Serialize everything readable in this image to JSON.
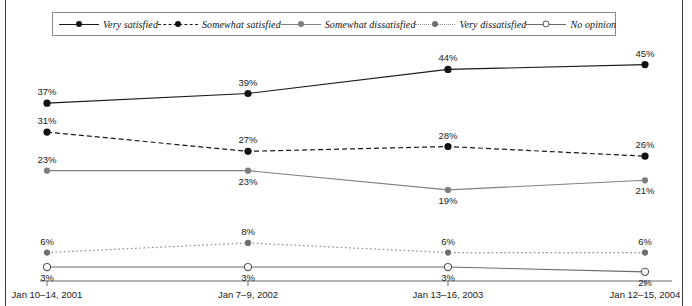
{
  "chart_data": {
    "type": "line",
    "title": "",
    "subtitle": "",
    "xlabel": "",
    "ylabel": "",
    "grid": false,
    "legend_position": "top",
    "ylim": [
      0,
      50
    ],
    "categories": [
      "Jan 10–14, 2001",
      "Jan 7–9, 2002",
      "Jan 13–16, 2003",
      "Jan 12–15, 2004"
    ],
    "series": [
      {
        "name": "Very satisfied",
        "values": [
          37,
          39,
          44,
          45
        ],
        "labels": [
          "37%",
          "39%",
          "44%",
          "45%"
        ],
        "color": "#1a1a1a",
        "line_style": "solid",
        "marker": "filled-circle",
        "marker_color": "#111111",
        "label_positions": [
          "above",
          "above",
          "above",
          "above"
        ]
      },
      {
        "name": "Somewhat satisfied",
        "values": [
          31,
          27,
          28,
          26
        ],
        "labels": [
          "31%",
          "27%",
          "28%",
          "26%"
        ],
        "color": "#1a1a1a",
        "line_style": "dashed",
        "marker": "filled-circle",
        "marker_color": "#111111",
        "label_positions": [
          "above",
          "above",
          "above",
          "above"
        ]
      },
      {
        "name": "Somewhat dissatisfied",
        "values": [
          23,
          23,
          19,
          21
        ],
        "labels": [
          "23%",
          "23%",
          "19%",
          "21%"
        ],
        "color": "#808080",
        "line_style": "solid",
        "marker": "filled-circle",
        "marker_color": "#7d7d7d",
        "label_positions": [
          "above",
          "below",
          "below",
          "below"
        ]
      },
      {
        "name": "Very dissatisfied",
        "values": [
          6,
          8,
          6,
          6
        ],
        "labels": [
          "6%",
          "8%",
          "6%",
          "6%"
        ],
        "color": "#8c8c8c",
        "line_style": "dotted",
        "marker": "filled-circle",
        "marker_color": "#6e6e6e",
        "label_positions": [
          "above",
          "above",
          "above",
          "above"
        ]
      },
      {
        "name": "No opinion",
        "values": [
          3,
          3,
          3,
          2
        ],
        "labels": [
          "3%",
          "3%",
          "3%",
          "2%"
        ],
        "color": "#6a6a6a",
        "line_style": "solid",
        "marker": "open-circle",
        "marker_color": "#555555",
        "label_positions": [
          "below",
          "below",
          "below",
          "below"
        ]
      }
    ]
  },
  "legend": {
    "items": [
      {
        "label": "Very satisfied",
        "swatch": "solid-filled-dot-marker"
      },
      {
        "label": "Somewhat satisfied",
        "swatch": "dashed-filled-dot-marker"
      },
      {
        "label": "Somewhat dissatisfied",
        "swatch": "solid-gray-filled-dot-marker"
      },
      {
        "label": "Very dissatisfied",
        "swatch": "dotted-gray-filled-dot-marker"
      },
      {
        "label": "No opinion",
        "swatch": "solid-gray-open-circle-marker"
      }
    ]
  },
  "axis": {
    "tick_labels": [
      "Jan 10–14, 2001",
      "Jan 7–9, 2002",
      "Jan 13–16, 2003",
      "Jan 12–15, 2004"
    ]
  }
}
